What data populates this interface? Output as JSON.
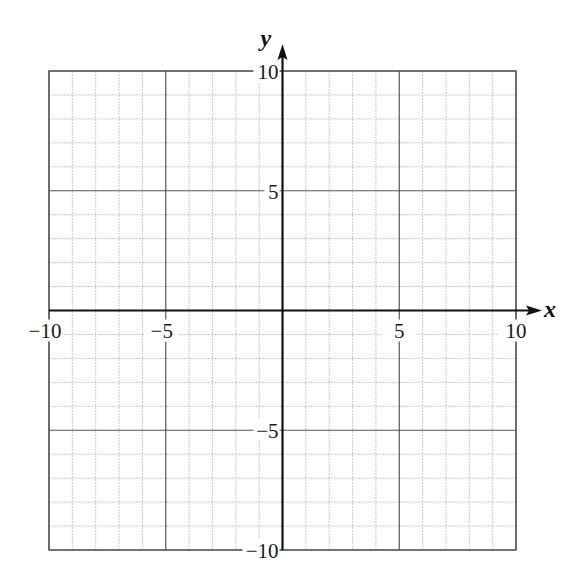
{
  "chart_data": {
    "type": "coordinate-grid",
    "title": "",
    "xlabel": "x",
    "ylabel": "y",
    "xlim": [
      -10,
      10
    ],
    "ylim": [
      -10,
      10
    ],
    "grid": true,
    "minor_step": 1,
    "major_step": 5,
    "x_ticks": [
      {
        "value": -10,
        "label": "−10"
      },
      {
        "value": -5,
        "label": "−5"
      },
      {
        "value": 5,
        "label": "5"
      },
      {
        "value": 10,
        "label": "10"
      }
    ],
    "y_ticks": [
      {
        "value": 10,
        "label": "10"
      },
      {
        "value": 5,
        "label": "5"
      },
      {
        "value": -5,
        "label": "−5"
      },
      {
        "value": -10,
        "label": "−10"
      }
    ],
    "series": []
  },
  "colors": {
    "minor_grid": "#bdbdbd",
    "major_grid": "#555555",
    "border": "#555555",
    "axis": "#111111"
  },
  "layout": {
    "left": 49,
    "right": 516,
    "top": 71,
    "bottom": 550
  }
}
